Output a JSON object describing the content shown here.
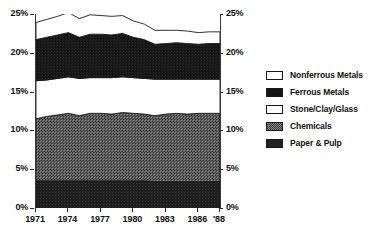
{
  "chart_data": {
    "type": "area",
    "stacked": true,
    "title": "",
    "subtitle": "",
    "xlabel": "",
    "ylabel": "",
    "grid": false,
    "legend_position": "right",
    "x": [
      1971,
      1972,
      1973,
      1974,
      1975,
      1976,
      1977,
      1978,
      1979,
      1980,
      1981,
      1982,
      1983,
      1984,
      1985,
      1986,
      1987,
      1988
    ],
    "x_tick_labels": [
      "1971",
      "1974",
      "1977",
      "1980",
      "1983",
      "1986",
      "'88"
    ],
    "x_tick_values": [
      1971,
      1974,
      1977,
      1980,
      1983,
      1986,
      1988
    ],
    "xlim": [
      1971,
      1988
    ],
    "ylim": [
      0,
      25
    ],
    "y_tick_labels_left": [
      "25%",
      "20%",
      "15%",
      "10%",
      "5%",
      "0%"
    ],
    "y_tick_labels_right": [
      "25%",
      "20%",
      "15%",
      "10%",
      "5%",
      "0%"
    ],
    "y_tick_values": [
      25,
      20,
      15,
      10,
      5,
      0
    ],
    "series": [
      {
        "name": "Paper & Pulp",
        "color": "#1b1b1b",
        "fill": "solid-dark",
        "values": [
          3.5,
          3.5,
          3.5,
          3.5,
          3.5,
          3.5,
          3.5,
          3.5,
          3.5,
          3.5,
          3.5,
          3.4,
          3.4,
          3.4,
          3.4,
          3.4,
          3.4,
          3.4
        ]
      },
      {
        "name": "Chemicals",
        "color": "#4f4f4f",
        "fill": "dither-medium",
        "values": [
          8.0,
          8.3,
          8.5,
          8.7,
          8.4,
          8.7,
          8.7,
          8.6,
          8.8,
          8.7,
          8.6,
          8.5,
          8.7,
          8.8,
          8.7,
          8.8,
          8.8,
          8.8
        ]
      },
      {
        "name": "Stone/Clay/Glass",
        "color": "#ffffff",
        "fill": "white",
        "values": [
          4.9,
          4.7,
          4.7,
          4.7,
          4.8,
          4.6,
          4.6,
          4.7,
          4.6,
          4.6,
          4.6,
          4.7,
          4.5,
          4.4,
          4.5,
          4.4,
          4.4,
          4.4
        ]
      },
      {
        "name": "Ferrous Metals",
        "color": "#141414",
        "fill": "solid-black",
        "values": [
          5.3,
          5.5,
          5.6,
          5.7,
          5.3,
          5.6,
          5.6,
          5.5,
          5.6,
          5.2,
          5.0,
          4.5,
          4.6,
          4.7,
          4.6,
          4.5,
          4.6,
          4.6
        ]
      },
      {
        "name": "Nonferrous Metals",
        "color": "#ffffff",
        "fill": "white-outline",
        "values": [
          2.2,
          2.3,
          2.4,
          2.6,
          2.4,
          2.5,
          2.4,
          2.4,
          2.3,
          2.1,
          2.0,
          1.8,
          1.7,
          1.6,
          1.6,
          1.5,
          1.5,
          1.5
        ]
      }
    ],
    "cumulative_tops": {
      "Paper & Pulp": [
        3.5,
        3.5,
        3.5,
        3.5,
        3.5,
        3.5,
        3.5,
        3.5,
        3.5,
        3.5,
        3.5,
        3.4,
        3.4,
        3.4,
        3.4,
        3.4,
        3.4,
        3.4
      ],
      "Chemicals": [
        11.5,
        11.8,
        12.0,
        12.2,
        11.9,
        12.2,
        12.2,
        12.1,
        12.3,
        12.2,
        12.1,
        11.9,
        12.1,
        12.2,
        12.1,
        12.2,
        12.2,
        12.2
      ],
      "Stone/Clay/Glass": [
        16.4,
        16.5,
        16.7,
        16.9,
        16.7,
        16.8,
        16.8,
        16.8,
        16.9,
        16.8,
        16.7,
        16.6,
        16.6,
        16.6,
        16.6,
        16.6,
        16.6,
        16.6
      ],
      "Ferrous Metals": [
        21.7,
        22.0,
        22.3,
        22.6,
        22.0,
        22.4,
        22.4,
        22.3,
        22.5,
        22.0,
        21.7,
        21.1,
        21.2,
        21.3,
        21.2,
        21.1,
        21.2,
        21.2
      ],
      "Nonferrous Metals": [
        23.9,
        24.3,
        24.7,
        25.2,
        24.4,
        24.9,
        24.8,
        24.7,
        24.8,
        24.1,
        23.7,
        22.9,
        22.9,
        22.9,
        22.8,
        22.6,
        22.7,
        22.7
      ]
    }
  },
  "legend": {
    "items": [
      {
        "label": "Nonferrous Metals",
        "swatch": "white-outline"
      },
      {
        "label": "Ferrous Metals",
        "swatch": "solid-black"
      },
      {
        "label": "Stone/Clay/Glass",
        "swatch": "white"
      },
      {
        "label": "Chemicals",
        "swatch": "dither-medium"
      },
      {
        "label": "Paper & Pulp",
        "swatch": "solid-dark"
      }
    ]
  },
  "axes": {
    "left_labels": [
      "25%",
      "20%",
      "15%",
      "10%",
      "5%",
      "0%"
    ],
    "right_labels": [
      "25%",
      "20%",
      "15%",
      "10%",
      "5%",
      "0%"
    ],
    "x_labels": [
      "1971",
      "1974",
      "1977",
      "1980",
      "1983",
      "1986",
      "'88"
    ]
  }
}
